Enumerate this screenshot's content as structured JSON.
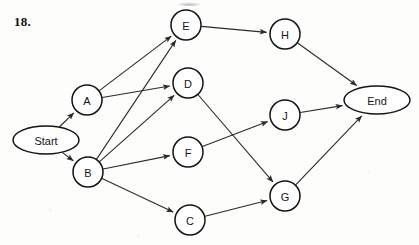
{
  "page": {
    "question_number": "18.",
    "background_color": "#fdfdfb",
    "ink_color": "#141414"
  },
  "diagram": {
    "type": "directed-graph",
    "title": "",
    "node_radius": 15,
    "terminal_rx": 33,
    "terminal_ry": 14,
    "nodes": [
      {
        "id": "Start",
        "label": "Start",
        "shape": "ellipse",
        "x": 46,
        "y": 140
      },
      {
        "id": "A",
        "label": "A",
        "shape": "circle",
        "x": 87,
        "y": 100
      },
      {
        "id": "B",
        "label": "B",
        "shape": "circle",
        "x": 88,
        "y": 172
      },
      {
        "id": "E",
        "label": "E",
        "shape": "circle",
        "x": 186,
        "y": 25
      },
      {
        "id": "D",
        "label": "D",
        "shape": "circle",
        "x": 188,
        "y": 83
      },
      {
        "id": "F",
        "label": "F",
        "shape": "circle",
        "x": 188,
        "y": 152
      },
      {
        "id": "C",
        "label": "C",
        "shape": "circle",
        "x": 190,
        "y": 220
      },
      {
        "id": "H",
        "label": "H",
        "shape": "circle",
        "x": 285,
        "y": 34
      },
      {
        "id": "J",
        "label": "J",
        "shape": "circle",
        "x": 285,
        "y": 115
      },
      {
        "id": "G",
        "label": "G",
        "shape": "circle",
        "x": 285,
        "y": 196
      },
      {
        "id": "End",
        "label": "End",
        "shape": "ellipse",
        "x": 377,
        "y": 100
      }
    ],
    "edges": [
      {
        "from": "Start",
        "to": "A"
      },
      {
        "from": "Start",
        "to": "B"
      },
      {
        "from": "A",
        "to": "E"
      },
      {
        "from": "A",
        "to": "D"
      },
      {
        "from": "B",
        "to": "E"
      },
      {
        "from": "B",
        "to": "D"
      },
      {
        "from": "B",
        "to": "F"
      },
      {
        "from": "B",
        "to": "C"
      },
      {
        "from": "E",
        "to": "H"
      },
      {
        "from": "D",
        "to": "G"
      },
      {
        "from": "F",
        "to": "J"
      },
      {
        "from": "C",
        "to": "G"
      },
      {
        "from": "H",
        "to": "End"
      },
      {
        "from": "J",
        "to": "End"
      },
      {
        "from": "G",
        "to": "End"
      }
    ]
  }
}
